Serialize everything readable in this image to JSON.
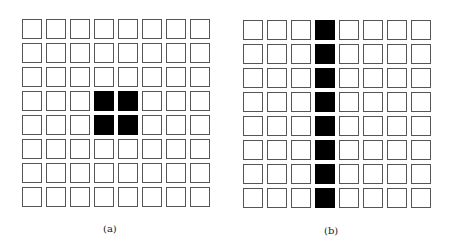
{
  "figures": [
    {
      "id": "a",
      "label": "(a)",
      "rows": 8,
      "cols": 8,
      "filled_cells": [
        [
          3,
          3
        ],
        [
          3,
          4
        ],
        [
          4,
          3
        ],
        [
          4,
          4
        ]
      ],
      "description": "8x8 pixel grid with a 2x2 filled block in the center"
    },
    {
      "id": "b",
      "label": "(b)",
      "rows": 8,
      "cols": 8,
      "filled_cells": [
        [
          0,
          3
        ],
        [
          1,
          3
        ],
        [
          2,
          3
        ],
        [
          3,
          3
        ],
        [
          4,
          3
        ],
        [
          5,
          3
        ],
        [
          6,
          3
        ],
        [
          7,
          3
        ]
      ],
      "description": "8x8 pixel grid with the fourth column fully filled (vertical line)"
    }
  ],
  "colors": {
    "filled": "#000000",
    "empty": "#ffffff",
    "border": "#555555"
  }
}
